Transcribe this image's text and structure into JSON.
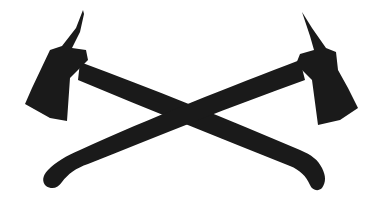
{
  "image": {
    "subject": "crossed-axes",
    "description": "Two crossed firefighter pick-head axes silhouette",
    "colors": {
      "fill": "#1a1a1a",
      "background": "#ffffff"
    }
  }
}
